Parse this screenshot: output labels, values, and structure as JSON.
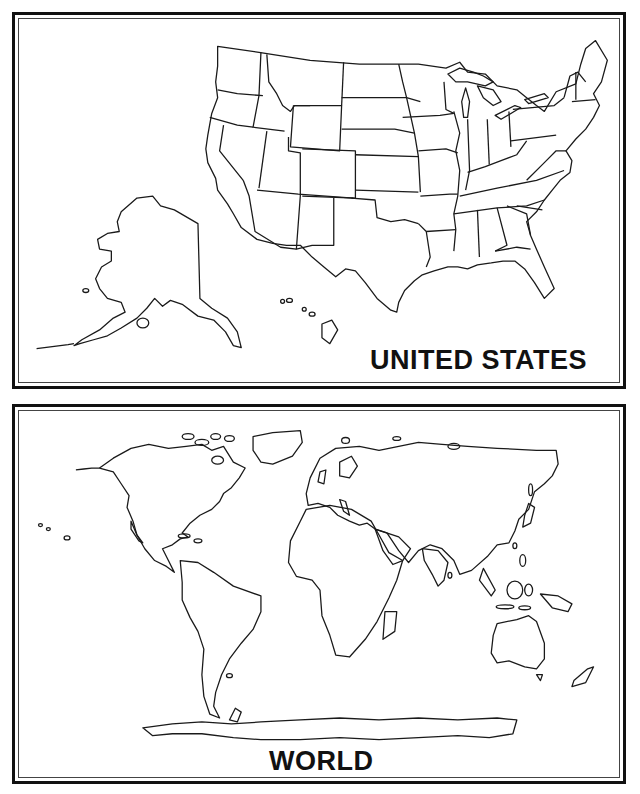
{
  "panels": {
    "us": {
      "title": "UNITED STATES",
      "map": "us-states-outline"
    },
    "world": {
      "title": "WORLD",
      "map": "world-continents-outline"
    }
  },
  "colors": {
    "line": "#1a1a1a",
    "border": "#111111",
    "background": "#ffffff"
  }
}
